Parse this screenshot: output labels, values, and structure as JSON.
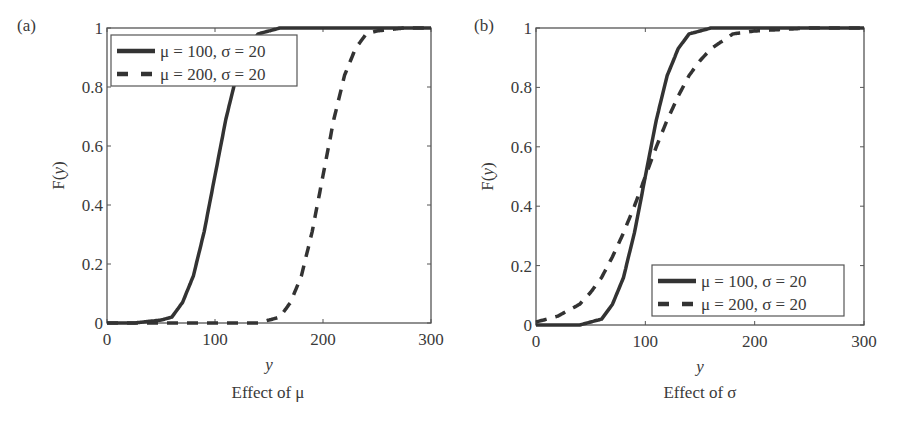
{
  "chart_data": [
    {
      "type": "line",
      "panel_label": "(a)",
      "title": "",
      "caption": "Effect of μ",
      "xlabel": "y",
      "ylabel": "F(y)",
      "xlim": [
        0,
        300
      ],
      "ylim": [
        0,
        1
      ],
      "xticks": [
        0,
        100,
        200,
        300
      ],
      "yticks": [
        0,
        0.2,
        0.4,
        0.6,
        0.8,
        1
      ],
      "ytick_labels": [
        "0",
        "0.2",
        "0.4",
        "0.6",
        "0.8",
        "1"
      ],
      "grid": false,
      "legend_position": "upper left",
      "x": [
        0,
        25,
        50,
        60,
        70,
        80,
        90,
        100,
        110,
        120,
        130,
        140,
        150,
        160,
        170,
        180,
        190,
        200,
        210,
        220,
        230,
        240,
        250,
        275,
        300
      ],
      "series": [
        {
          "name": "μ = 100, σ = 20",
          "style": "solid",
          "values": [
            0,
            0,
            0.01,
            0.02,
            0.07,
            0.16,
            0.31,
            0.5,
            0.69,
            0.84,
            0.93,
            0.98,
            0.99,
            1,
            1,
            1,
            1,
            1,
            1,
            1,
            1,
            1,
            1,
            1,
            1
          ]
        },
        {
          "name": "μ = 200, σ = 20",
          "style": "dashed",
          "values": [
            0,
            0,
            0,
            0,
            0,
            0,
            0,
            0,
            0,
            0,
            0,
            0,
            0.01,
            0.02,
            0.07,
            0.16,
            0.31,
            0.5,
            0.69,
            0.84,
            0.93,
            0.98,
            0.99,
            1,
            1
          ]
        }
      ]
    },
    {
      "type": "line",
      "panel_label": "(b)",
      "title": "",
      "caption": "Effect of σ",
      "xlabel": "y",
      "ylabel": "F(y)",
      "xlim": [
        0,
        300
      ],
      "ylim": [
        0,
        1
      ],
      "xticks": [
        0,
        100,
        200,
        300
      ],
      "yticks": [
        0,
        0.2,
        0.4,
        0.6,
        0.8,
        1
      ],
      "ytick_labels": [
        "0",
        "0.2",
        "0.4",
        "0.6",
        "0.8",
        "1"
      ],
      "grid": false,
      "legend_position": "lower right",
      "x": [
        0,
        20,
        40,
        50,
        60,
        70,
        80,
        90,
        100,
        110,
        120,
        130,
        140,
        150,
        160,
        180,
        200,
        250,
        300
      ],
      "series": [
        {
          "name": "μ = 100, σ = 20",
          "style": "solid",
          "values": [
            0,
            0,
            0.0,
            0.01,
            0.02,
            0.07,
            0.16,
            0.31,
            0.5,
            0.69,
            0.84,
            0.93,
            0.98,
            0.99,
            1,
            1,
            1,
            1,
            1
          ]
        },
        {
          "name": "μ = 200, σ = 20",
          "style": "dashed",
          "values": [
            0.01,
            0.03,
            0.07,
            0.11,
            0.16,
            0.23,
            0.31,
            0.4,
            0.5,
            0.6,
            0.69,
            0.77,
            0.84,
            0.89,
            0.93,
            0.98,
            0.99,
            1,
            1
          ]
        }
      ]
    }
  ]
}
